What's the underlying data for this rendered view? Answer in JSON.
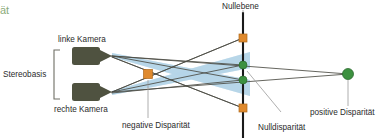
{
  "figure": {
    "title_fragment": "ät",
    "labels": {
      "stereobasis": "Stereobasis",
      "left_camera": "linke Kamera",
      "right_camera": "rechte Kamera",
      "zero_plane": "Nullebene",
      "negative_disparity": "negative Disparität",
      "zero_disparity": "Nulldisparität",
      "positive_disparity": "positive Disparität"
    },
    "colors": {
      "camera_body": "#4f5240",
      "frustum_fill": "#bdd9ea",
      "frustum_stroke": "#5f7f96",
      "ray_line": "#4a4a42",
      "plane_line": "#1a1a1a",
      "marker_orange": "#e08a2e",
      "marker_green": "#3d9140",
      "leader_line": "#9a9a9a",
      "bracket": "#6e6e64",
      "text": "#2b2b2b",
      "title_green": "#8aab7a",
      "background": "#ffffff"
    },
    "geometry": {
      "left_camera_xy": [
        95,
        56
      ],
      "right_camera_xy": [
        95,
        92
      ],
      "plane_x": 243,
      "plane_y_top": 12,
      "plane_y_bottom": 138,
      "negative_marker_xy": [
        148,
        74
      ],
      "plane_negative_top_xy": [
        243,
        38
      ],
      "plane_negative_bottom_xy": [
        243,
        108
      ],
      "plane_zero_upper_xy": [
        243,
        65
      ],
      "plane_zero_lower_xy": [
        243,
        80
      ],
      "positive_marker_xy": [
        348,
        74
      ]
    },
    "markers": [
      {
        "name": "negative-disparity-square",
        "shape": "square",
        "color": "#e08a2e",
        "x": 148,
        "y": 74,
        "size": 9
      },
      {
        "name": "plane-negative-top-square",
        "shape": "square",
        "color": "#e08a2e",
        "x": 243,
        "y": 38,
        "size": 8
      },
      {
        "name": "plane-negative-bottom-square",
        "shape": "square",
        "color": "#e08a2e",
        "x": 243,
        "y": 108,
        "size": 8
      },
      {
        "name": "zero-disparity-dot-upper",
        "shape": "circle",
        "color": "#3d9140",
        "x": 243,
        "y": 65,
        "r": 4
      },
      {
        "name": "zero-disparity-dot-lower",
        "shape": "circle",
        "color": "#3d9140",
        "x": 243,
        "y": 80,
        "r": 4
      },
      {
        "name": "positive-disparity-dot",
        "shape": "circle",
        "color": "#3d9140",
        "x": 348,
        "y": 74,
        "r": 5.5
      }
    ]
  }
}
